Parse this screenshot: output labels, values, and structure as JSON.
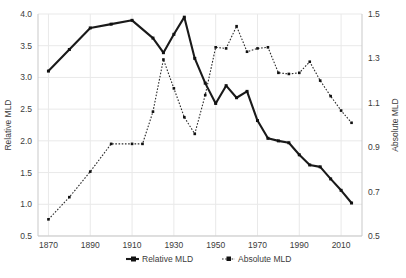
{
  "chart_data": {
    "type": "line",
    "title": "",
    "xlabel": "",
    "ylabel": "Relative MLD",
    "y2label": "Absolute MLD",
    "xlim": [
      1865,
      2020
    ],
    "ylim": [
      0.5,
      4.0
    ],
    "y2lim": [
      0.5,
      1.5
    ],
    "grid": true,
    "legend_position": "bottom-center",
    "xticks": [
      1870,
      1890,
      1910,
      1930,
      1950,
      1970,
      1990,
      2010
    ],
    "yticks": [
      0.5,
      1.0,
      1.5,
      2.0,
      2.5,
      3.0,
      3.5,
      4.0
    ],
    "y2ticks": [
      0.5,
      0.7,
      0.9,
      1.1,
      1.3,
      1.5
    ],
    "series": [
      {
        "name": "Relative MLD",
        "axis": "left",
        "style": "solid",
        "marker": "square",
        "x": [
          1870,
          1880,
          1890,
          1900,
          1910,
          1920,
          1925,
          1930,
          1935,
          1940,
          1945,
          1950,
          1955,
          1960,
          1965,
          1970,
          1975,
          1980,
          1985,
          1990,
          1995,
          2000,
          2005,
          2010,
          2015
        ],
        "values": [
          3.1,
          3.44,
          3.78,
          3.84,
          3.9,
          3.62,
          3.39,
          3.68,
          3.95,
          3.3,
          2.91,
          2.59,
          2.87,
          2.68,
          2.78,
          2.32,
          2.04,
          2.0,
          1.97,
          1.78,
          1.62,
          1.59,
          1.4,
          1.22,
          1.02
        ]
      },
      {
        "name": "Absolute MLD",
        "axis": "right",
        "style": "dotted",
        "marker": "square",
        "x": [
          1870,
          1880,
          1890,
          1900,
          1910,
          1915,
          1920,
          1925,
          1930,
          1935,
          1940,
          1945,
          1950,
          1955,
          1960,
          1965,
          1970,
          1975,
          1980,
          1985,
          1990,
          1995,
          2000,
          2005,
          2010,
          2015
        ],
        "values": [
          0.575,
          0.675,
          0.79,
          0.915,
          0.915,
          0.915,
          1.06,
          1.295,
          1.165,
          1.035,
          0.96,
          1.135,
          1.35,
          1.345,
          1.445,
          1.33,
          1.345,
          1.35,
          1.235,
          1.23,
          1.235,
          1.285,
          1.2,
          1.13,
          1.065,
          1.01
        ]
      }
    ]
  },
  "legend": {
    "items": [
      {
        "label": "Relative MLD"
      },
      {
        "label": "Absolute MLD"
      }
    ]
  },
  "axes": {
    "left_title": "Relative MLD",
    "right_title": "Absolute MLD"
  }
}
